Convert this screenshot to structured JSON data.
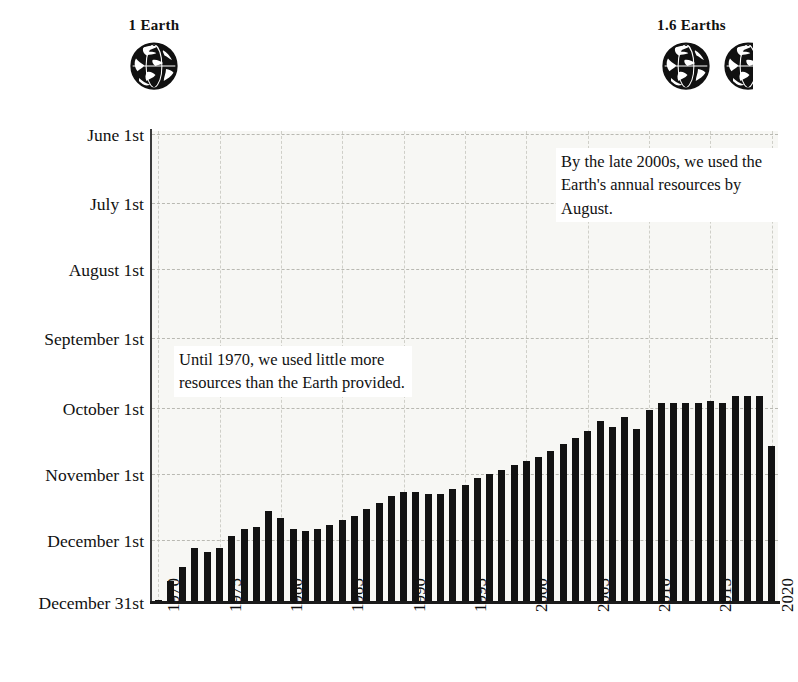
{
  "title_left": "1 Earth",
  "title_right": "1.6 Earths",
  "icons": {
    "globe_left": "globe-icon",
    "globe_right_full": "globe-icon",
    "globe_right_partial": "half-globe-icon"
  },
  "annotations": {
    "left": "Until 1970, we used little more resources than the Earth provided.",
    "right": "By the late 2000s, we used the Earth's annual resources by August."
  },
  "colors": {
    "bar": "#121212",
    "plot_background": "#f7f7f4",
    "grid": "#b9b9b2",
    "axis": "#1b1b1b",
    "text": "#111111"
  },
  "chart_data": {
    "type": "bar",
    "title": "",
    "xlabel": "",
    "ylabel": "",
    "grid": true,
    "legend": "none",
    "ylim": [
      "December 31st",
      "June 1st"
    ],
    "ytick_labels": [
      "June 1st",
      "July 1st",
      "August 1st",
      "September 1st",
      "October 1st",
      "November 1st",
      "December 1st",
      "December 31st"
    ],
    "ytick_days": [
      152,
      182,
      213,
      244,
      274,
      305,
      335,
      365
    ],
    "xtick_labels": [
      "1970",
      "1975",
      "1980",
      "1985",
      "1990",
      "1995",
      "2000",
      "2005",
      "2010",
      "2015",
      "2020"
    ],
    "xlim": [
      1970,
      2020
    ],
    "categories": [
      1970,
      1971,
      1972,
      1973,
      1974,
      1975,
      1976,
      1977,
      1978,
      1979,
      1980,
      1981,
      1982,
      1983,
      1984,
      1985,
      1986,
      1987,
      1988,
      1989,
      1990,
      1991,
      1992,
      1993,
      1994,
      1995,
      1996,
      1997,
      1998,
      1999,
      2000,
      2001,
      2002,
      2003,
      2004,
      2005,
      2006,
      2007,
      2008,
      2009,
      2010,
      2011,
      2012,
      2013,
      2014,
      2015,
      2016,
      2017,
      2018,
      2019,
      2020
    ],
    "values": [
      364,
      355,
      348,
      339,
      341,
      339,
      333,
      330,
      329,
      322,
      325,
      330,
      331,
      330,
      328,
      326,
      324,
      321,
      318,
      315,
      313,
      313,
      314,
      314,
      312,
      310,
      307,
      305,
      303,
      301,
      299,
      297,
      294,
      291,
      288,
      285,
      280,
      283,
      278,
      284,
      275,
      272,
      272,
      272,
      272,
      271,
      272,
      269,
      269,
      269,
      292
    ],
    "value_units": "day of year on which the Earth's annual resources are exhausted"
  }
}
